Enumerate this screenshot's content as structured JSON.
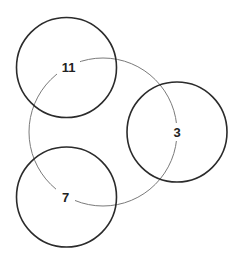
{
  "diagram": {
    "width": 238,
    "height": 259,
    "ring": {
      "cx": 103,
      "cy": 132,
      "r": 74,
      "color": "#7a7a7a"
    },
    "circles": [
      {
        "id": "top-left",
        "cx": 66.5,
        "cy": 67.5,
        "r": 50,
        "color": "#2b2b2b"
      },
      {
        "id": "right",
        "cx": 177,
        "cy": 132,
        "r": 50,
        "color": "#2b2b2b"
      },
      {
        "id": "bottom-left",
        "cx": 66.5,
        "cy": 197,
        "r": 50,
        "color": "#2b2b2b"
      }
    ],
    "labels": [
      {
        "text": "11",
        "x": 68.5,
        "y": 67.5
      },
      {
        "text": "3",
        "x": 177,
        "y": 132
      },
      {
        "text": "7",
        "x": 65.5,
        "y": 197
      }
    ]
  }
}
